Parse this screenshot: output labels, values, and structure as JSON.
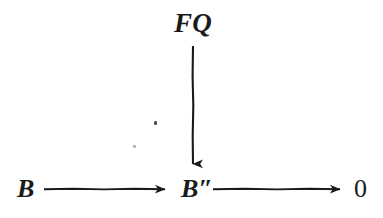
{
  "figure": {
    "type": "commutative-diagram",
    "background_color": "#ffffff",
    "ink_color": "#1a1a1a"
  },
  "nodes": {
    "fq": {
      "label": "FQ",
      "x": 193,
      "y": 25
    },
    "b": {
      "label": "B",
      "x": 27,
      "y": 189
    },
    "b_double_prime": {
      "label": "B″",
      "x": 196,
      "y": 189
    },
    "zero": {
      "label": "0",
      "x": 363,
      "y": 189
    }
  },
  "arrows": [
    {
      "name": "arrow-fq-to-bpp",
      "label": "",
      "direction": "down",
      "from": "fq",
      "to": "b_double_prime",
      "x1": 193,
      "y1": 46,
      "x2": 193,
      "y2": 172
    },
    {
      "name": "arrow-b-to-bpp",
      "label": "",
      "direction": "right",
      "from": "b",
      "to": "b_double_prime",
      "x1": 44,
      "y1": 189,
      "x2": 174,
      "y2": 189
    },
    {
      "name": "arrow-bpp-to-zero",
      "label": "",
      "direction": "right",
      "from": "b_double_prime",
      "to": "zero",
      "x1": 213,
      "y1": 189,
      "x2": 349,
      "y2": 189
    }
  ],
  "artifacts": [
    {
      "name": "scan-speck-upper",
      "x": 155,
      "y": 123
    },
    {
      "name": "scan-speck-lower",
      "x": 134,
      "y": 146
    }
  ]
}
